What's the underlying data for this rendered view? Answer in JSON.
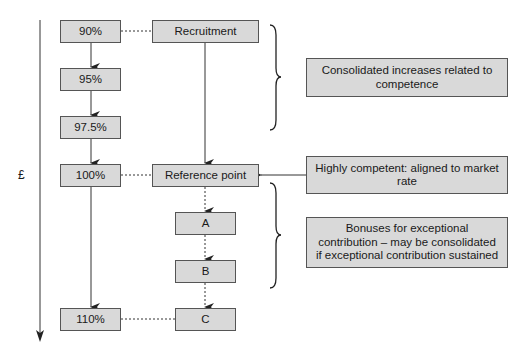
{
  "axis": {
    "label": "£"
  },
  "left_column": [
    {
      "id": "p90",
      "label": "90%"
    },
    {
      "id": "p95",
      "label": "95%"
    },
    {
      "id": "p97_5",
      "label": "97.5%"
    },
    {
      "id": "p100",
      "label": "100%"
    },
    {
      "id": "p110",
      "label": "110%"
    }
  ],
  "middle_column": [
    {
      "id": "recruitment",
      "label": "Recruitment"
    },
    {
      "id": "reference",
      "label": "Reference point"
    },
    {
      "id": "a",
      "label": "A"
    },
    {
      "id": "b",
      "label": "B"
    },
    {
      "id": "c",
      "label": "C"
    }
  ],
  "notes": [
    {
      "id": "consolidated",
      "label": "Consolidated increases related to competence"
    },
    {
      "id": "highly_competent",
      "label": "Highly competent: aligned to market rate"
    },
    {
      "id": "bonuses",
      "label": "Bonuses for exceptional contribution – may be consolidated if exceptional contribution sustained"
    }
  ],
  "colors": {
    "box_fill": "#d9d9d9",
    "box_border": "#555555",
    "line": "#333333"
  }
}
